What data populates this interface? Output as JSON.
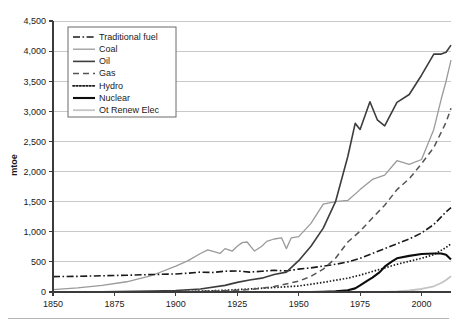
{
  "chart_data": {
    "type": "line",
    "title": "",
    "xlabel": "",
    "ylabel": "mtoe",
    "xlim": [
      1850,
      2012
    ],
    "ylim": [
      0,
      4500
    ],
    "grid": true,
    "legend_position": "top-left",
    "xticks": [
      "1850",
      "1875",
      "1900",
      "1925",
      "1950",
      "1975",
      "2000"
    ],
    "xtick_values": [
      1850,
      1875,
      1900,
      1925,
      1950,
      1975,
      2000
    ],
    "yticks": [
      "0",
      "500",
      "1,000",
      "1,500",
      "2,000",
      "2,500",
      "3,000",
      "3,500",
      "4,000",
      "4,500"
    ],
    "ytick_values": [
      0,
      500,
      1000,
      1500,
      2000,
      2500,
      3000,
      3500,
      4000,
      4500
    ],
    "series": [
      {
        "name": "Traditional fuel",
        "style": "dashdot",
        "color": "#1a1a1a",
        "width": 1.6,
        "dash": "7,2.5,1.6,2.5",
        "x": [
          1850,
          1860,
          1870,
          1880,
          1890,
          1900,
          1905,
          1910,
          1915,
          1920,
          1925,
          1930,
          1935,
          1940,
          1945,
          1950,
          1955,
          1960,
          1965,
          1970,
          1975,
          1980,
          1985,
          1990,
          1995,
          2000,
          2005,
          2010,
          2012
        ],
        "values": [
          255,
          260,
          270,
          278,
          290,
          300,
          312,
          330,
          325,
          345,
          350,
          330,
          345,
          360,
          350,
          380,
          400,
          430,
          460,
          500,
          560,
          640,
          720,
          800,
          880,
          980,
          1120,
          1330,
          1400
        ]
      },
      {
        "name": "Coal",
        "style": "solid-thin-gray",
        "color": "#9a9a9a",
        "width": 1.3,
        "dash": "none",
        "x": [
          1850,
          1860,
          1870,
          1880,
          1890,
          1900,
          1905,
          1910,
          1913,
          1918,
          1920,
          1923,
          1925,
          1927,
          1929,
          1932,
          1935,
          1937,
          1940,
          1943,
          1945,
          1947,
          1950,
          1955,
          1960,
          1965,
          1970,
          1975,
          1980,
          1985,
          1990,
          1995,
          2000,
          2005,
          2008,
          2010,
          2012
        ],
        "values": [
          40,
          70,
          110,
          170,
          270,
          430,
          520,
          640,
          700,
          640,
          720,
          680,
          760,
          820,
          830,
          680,
          760,
          840,
          880,
          900,
          720,
          900,
          920,
          1140,
          1460,
          1500,
          1520,
          1700,
          1870,
          1940,
          2180,
          2120,
          2200,
          2700,
          3200,
          3500,
          3850
        ]
      },
      {
        "name": "Oil",
        "style": "solid-dark",
        "color": "#3d3d3d",
        "width": 1.6,
        "dash": "none",
        "x": [
          1850,
          1870,
          1890,
          1900,
          1910,
          1920,
          1925,
          1930,
          1935,
          1940,
          1945,
          1950,
          1955,
          1960,
          1965,
          1970,
          1973,
          1975,
          1979,
          1982,
          1985,
          1990,
          1995,
          2000,
          2005,
          2008,
          2010,
          2012
        ],
        "values": [
          2,
          5,
          15,
          25,
          50,
          110,
          160,
          200,
          230,
          290,
          330,
          520,
          760,
          1060,
          1500,
          2250,
          2800,
          2700,
          3160,
          2860,
          2760,
          3150,
          3280,
          3600,
          3950,
          3950,
          3980,
          4100
        ]
      },
      {
        "name": "Gas",
        "style": "dashed",
        "color": "#555555",
        "width": 1.5,
        "dash": "6,4",
        "x": [
          1850,
          1900,
          1920,
          1930,
          1940,
          1950,
          1955,
          1960,
          1965,
          1970,
          1975,
          1980,
          1985,
          1990,
          1995,
          2000,
          2005,
          2010,
          2012
        ],
        "values": [
          0,
          5,
          20,
          40,
          90,
          180,
          260,
          380,
          560,
          830,
          1010,
          1230,
          1440,
          1700,
          1880,
          2130,
          2400,
          2820,
          3050
        ]
      },
      {
        "name": "Hydro",
        "style": "dotted",
        "color": "#1a1a1a",
        "width": 1.7,
        "dash": "1.5,1.8",
        "x": [
          1850,
          1890,
          1900,
          1910,
          1920,
          1930,
          1940,
          1950,
          1960,
          1970,
          1975,
          1980,
          1985,
          1990,
          1995,
          2000,
          2005,
          2010,
          2012
        ],
        "values": [
          0,
          2,
          6,
          14,
          28,
          50,
          75,
          100,
          160,
          230,
          280,
          340,
          400,
          460,
          510,
          560,
          620,
          740,
          800
        ]
      },
      {
        "name": "Nuclear",
        "style": "solid-thick-black",
        "color": "#0d0d0d",
        "width": 2.1,
        "dash": "none",
        "x": [
          1850,
          1955,
          1960,
          1965,
          1970,
          1973,
          1975,
          1978,
          1980,
          1983,
          1985,
          1988,
          1990,
          1995,
          2000,
          2005,
          2008,
          2010,
          2012
        ],
        "values": [
          0,
          0,
          3,
          10,
          30,
          60,
          110,
          190,
          240,
          330,
          420,
          510,
          560,
          600,
          630,
          640,
          640,
          620,
          540
        ]
      },
      {
        "name": "Ot Renew Elec",
        "style": "solid-lightgray",
        "color": "#c4c4c4",
        "width": 1.8,
        "dash": "none",
        "x": [
          1850,
          1985,
          1990,
          1995,
          2000,
          2005,
          2008,
          2010,
          2012
        ],
        "values": [
          0,
          0,
          8,
          25,
          50,
          95,
          150,
          200,
          260
        ]
      }
    ]
  },
  "legend": {
    "items": [
      {
        "label": "Traditional fuel"
      },
      {
        "label": "Coal"
      },
      {
        "label": "Oil"
      },
      {
        "label": "Gas"
      },
      {
        "label": "Hydro"
      },
      {
        "label": "Nuclear"
      },
      {
        "label": "Ot Renew Elec"
      }
    ]
  }
}
